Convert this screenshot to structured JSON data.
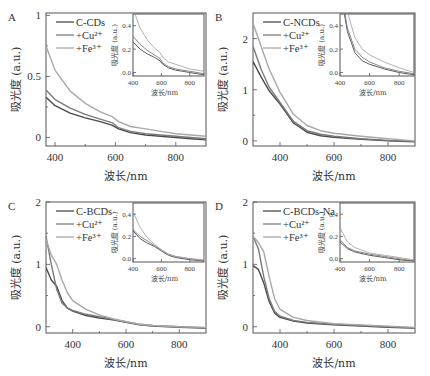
{
  "figure": {
    "ylabel": "吸光度 (a.u.)",
    "xlabel": "波长/nm",
    "colors": {
      "base": "#4a4a4a",
      "cu": "#7a7a7a",
      "fe": "#a8a8a8",
      "axis": "#555555"
    }
  },
  "chart_data": [
    {
      "type": "line",
      "panel": "A",
      "title": "",
      "xlabel": "波长/nm",
      "ylabel": "吸光度 (a.u.)",
      "xlim": [
        370,
        900
      ],
      "ylim": [
        -0.07,
        1.02
      ],
      "xticks": [
        400,
        600,
        800
      ],
      "yticks": [
        0,
        0.5,
        1
      ],
      "ytick_labels": [
        "0",
        "0.5",
        "1"
      ],
      "legend": [
        "C-CDs",
        "+Cu²⁺",
        "+Fe³⁺"
      ],
      "legend_position": "upper-left",
      "x": [
        370,
        400,
        450,
        500,
        550,
        590,
        610,
        650,
        700,
        750,
        800,
        850,
        900
      ],
      "series": [
        {
          "name": "C-CDs",
          "values": [
            0.33,
            0.26,
            0.2,
            0.16,
            0.13,
            0.1,
            0.07,
            0.04,
            0.02,
            0.01,
            0.0,
            -0.01,
            -0.02
          ]
        },
        {
          "name": "+Cu²⁺",
          "values": [
            0.39,
            0.31,
            0.24,
            0.19,
            0.15,
            0.12,
            0.08,
            0.05,
            0.03,
            0.02,
            0.01,
            0.0,
            -0.01
          ]
        },
        {
          "name": "+Fe³⁺",
          "values": [
            0.75,
            0.55,
            0.38,
            0.28,
            0.21,
            0.17,
            0.13,
            0.09,
            0.07,
            0.05,
            0.03,
            0.02,
            0.01
          ]
        }
      ],
      "inset": {
        "xlim": [
          400,
          900
        ],
        "ylim": [
          -0.03,
          0.5
        ],
        "xticks": [
          400,
          600,
          800
        ],
        "yticks": [
          0.0,
          0.2,
          0.4
        ],
        "ytick_labels": [
          "0.0",
          "0.2",
          "0.4"
        ],
        "xlabel": "波长/nm",
        "ylabel": "吸光度 (a.u.)"
      }
    },
    {
      "type": "line",
      "panel": "B",
      "xlabel": "波长/nm",
      "ylabel": "吸光度 (a.u.)",
      "xlim": [
        300,
        900
      ],
      "ylim": [
        -0.1,
        2.5
      ],
      "xticks": [
        400,
        600,
        800
      ],
      "yticks": [
        0,
        1,
        2
      ],
      "ytick_labels": [
        "0",
        "1",
        "2"
      ],
      "legend": [
        "C-NCDs",
        "+Cu²⁺",
        "+Fe³⁺"
      ],
      "legend_position": "upper-left",
      "x": [
        300,
        330,
        360,
        400,
        450,
        500,
        550,
        600,
        700,
        800,
        900
      ],
      "series": [
        {
          "name": "C-NCDs",
          "values": [
            1.55,
            1.25,
            0.98,
            0.72,
            0.35,
            0.17,
            0.1,
            0.07,
            0.03,
            0.0,
            -0.02
          ]
        },
        {
          "name": "+Cu²⁺",
          "values": [
            1.85,
            1.4,
            1.05,
            0.75,
            0.38,
            0.2,
            0.13,
            0.09,
            0.04,
            0.01,
            -0.01
          ]
        },
        {
          "name": "+Fe³⁺",
          "values": [
            2.3,
            1.85,
            1.4,
            0.95,
            0.52,
            0.3,
            0.2,
            0.15,
            0.09,
            0.04,
            0.0
          ]
        }
      ],
      "inset": {
        "xlim": [
          400,
          900
        ],
        "ylim": [
          -0.03,
          0.5
        ],
        "xticks": [
          400,
          600,
          800
        ],
        "yticks": [
          0.0,
          0.2,
          0.4
        ],
        "ytick_labels": [
          "0.0",
          "0.2",
          "0.4"
        ],
        "xlabel": "波长/nm",
        "ylabel": "吸光度 (a.u.)"
      }
    },
    {
      "type": "line",
      "panel": "C",
      "xlabel": "波长/nm",
      "ylabel": "吸光度 (a.u.)",
      "xlim": [
        300,
        900
      ],
      "ylim": [
        -0.1,
        2.0
      ],
      "xticks": [
        400,
        600,
        800
      ],
      "yticks": [
        0,
        1,
        2
      ],
      "ytick_labels": [
        "0",
        "1",
        "2"
      ],
      "legend": [
        "C-BCDs",
        "+Cu²⁺",
        "+Fe³⁺"
      ],
      "legend_position": "upper-left",
      "x": [
        300,
        320,
        340,
        360,
        380,
        400,
        450,
        500,
        550,
        600,
        650,
        700,
        800,
        900
      ],
      "series": [
        {
          "name": "C-BCDs",
          "values": [
            0.95,
            0.75,
            0.65,
            0.42,
            0.3,
            0.25,
            0.18,
            0.14,
            0.11,
            0.07,
            0.03,
            0.01,
            -0.01,
            -0.02
          ]
        },
        {
          "name": "+Cu²⁺",
          "values": [
            1.45,
            1.0,
            0.6,
            0.38,
            0.3,
            0.26,
            0.2,
            0.16,
            0.12,
            0.08,
            0.04,
            0.02,
            0.0,
            -0.02
          ]
        },
        {
          "name": "+Fe³⁺",
          "values": [
            1.4,
            1.15,
            1.0,
            0.75,
            0.55,
            0.42,
            0.28,
            0.19,
            0.13,
            0.08,
            0.04,
            0.02,
            0.0,
            -0.01
          ]
        }
      ],
      "inset": {
        "xlim": [
          400,
          900
        ],
        "ylim": [
          -0.03,
          0.5
        ],
        "xticks": [
          400,
          600,
          800
        ],
        "yticks": [
          0.0,
          0.2,
          0.4
        ],
        "ytick_labels": [
          "0.0",
          "0.2",
          "0.4"
        ],
        "xlabel": "波长/nm",
        "ylabel": "吸光度 (a.u.)"
      }
    },
    {
      "type": "line",
      "panel": "D",
      "xlabel": "波长/nm",
      "ylabel": "吸光度 (a.u.)",
      "xlim": [
        300,
        900
      ],
      "ylim": [
        -0.1,
        2.0
      ],
      "xticks": [
        400,
        600,
        800
      ],
      "yticks": [
        0,
        1,
        2
      ],
      "ytick_labels": [
        "0",
        "1",
        "2"
      ],
      "legend": [
        "C-BCDs-Na",
        "+Cu²⁺",
        "+Fe³⁺"
      ],
      "legend_position": "upper-left",
      "x": [
        300,
        320,
        340,
        360,
        380,
        400,
        450,
        500,
        600,
        700,
        800,
        900
      ],
      "series": [
        {
          "name": "C-BCDs-Na",
          "values": [
            0.98,
            0.92,
            0.7,
            0.4,
            0.22,
            0.15,
            0.09,
            0.06,
            0.03,
            0.01,
            -0.01,
            -0.02
          ]
        },
        {
          "name": "+Cu²⁺",
          "values": [
            1.45,
            1.25,
            0.8,
            0.45,
            0.25,
            0.17,
            0.1,
            0.07,
            0.04,
            0.02,
            0.0,
            -0.02
          ]
        },
        {
          "name": "+Fe³⁺",
          "values": [
            1.45,
            1.35,
            1.2,
            0.8,
            0.45,
            0.28,
            0.15,
            0.1,
            0.05,
            0.03,
            0.01,
            -0.01
          ]
        }
      ],
      "inset": {
        "xlim": [
          400,
          900
        ],
        "ylim": [
          -0.03,
          0.5
        ],
        "xticks": [
          400,
          600,
          800
        ],
        "yticks": [
          0.0,
          0.2,
          0.4
        ],
        "ytick_labels": [
          "0.0",
          "0.2",
          "0.4"
        ],
        "xlabel": "波长/nm",
        "ylabel": "吸光度 (a.u.)"
      }
    }
  ]
}
